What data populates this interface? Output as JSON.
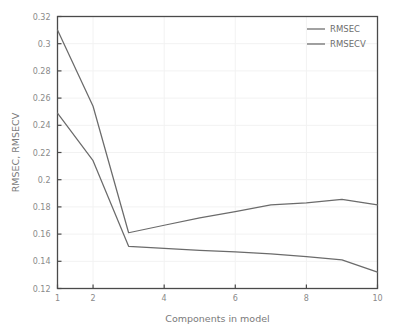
{
  "chart_data": {
    "type": "line",
    "title": "",
    "xlabel": "Components in model",
    "ylabel": "RMSEC, RMSECV",
    "x": [
      1,
      2,
      3,
      4,
      5,
      6,
      7,
      8,
      9,
      10
    ],
    "xlim": [
      1,
      10
    ],
    "ylim": [
      0.12,
      0.32
    ],
    "xticks": [
      1,
      2,
      4,
      6,
      8,
      10
    ],
    "xtick_labels": [
      "1",
      "2",
      "4",
      "6",
      "8",
      "10"
    ],
    "yticks": [
      0.12,
      0.14,
      0.16,
      0.18,
      0.2,
      0.22,
      0.24,
      0.26,
      0.28,
      0.3,
      0.32
    ],
    "ytick_labels": [
      "0.12",
      "0.14",
      "0.16",
      "0.18",
      "0.2",
      "0.22",
      "0.24",
      "0.26",
      "0.28",
      "0.3",
      "0.32"
    ],
    "grid": true,
    "legend_position": "top-right",
    "series": [
      {
        "name": "RMSEC",
        "color": "#6b6b6b",
        "values": [
          0.249,
          0.214,
          0.151,
          0.1495,
          0.148,
          0.147,
          0.1455,
          0.1435,
          0.141,
          0.132
        ]
      },
      {
        "name": "RMSECV",
        "color": "#6b6b6b",
        "values": [
          0.31,
          0.254,
          0.161,
          0.1665,
          0.172,
          0.1765,
          0.1815,
          0.183,
          0.1855,
          0.1815
        ]
      }
    ]
  },
  "legend": {
    "items": [
      {
        "label": "RMSEC"
      },
      {
        "label": "RMSECV"
      }
    ]
  },
  "axes": {
    "x_title": "Components in model",
    "y_title": "RMSEC, RMSECV"
  },
  "colors": {
    "background": "#ffffff",
    "axis": "#4a4a4a",
    "grid": "#f2f2f2",
    "line": "#6b6b6b",
    "tick_text": "#8a8a8a",
    "label_text": "#7a7a7a"
  }
}
